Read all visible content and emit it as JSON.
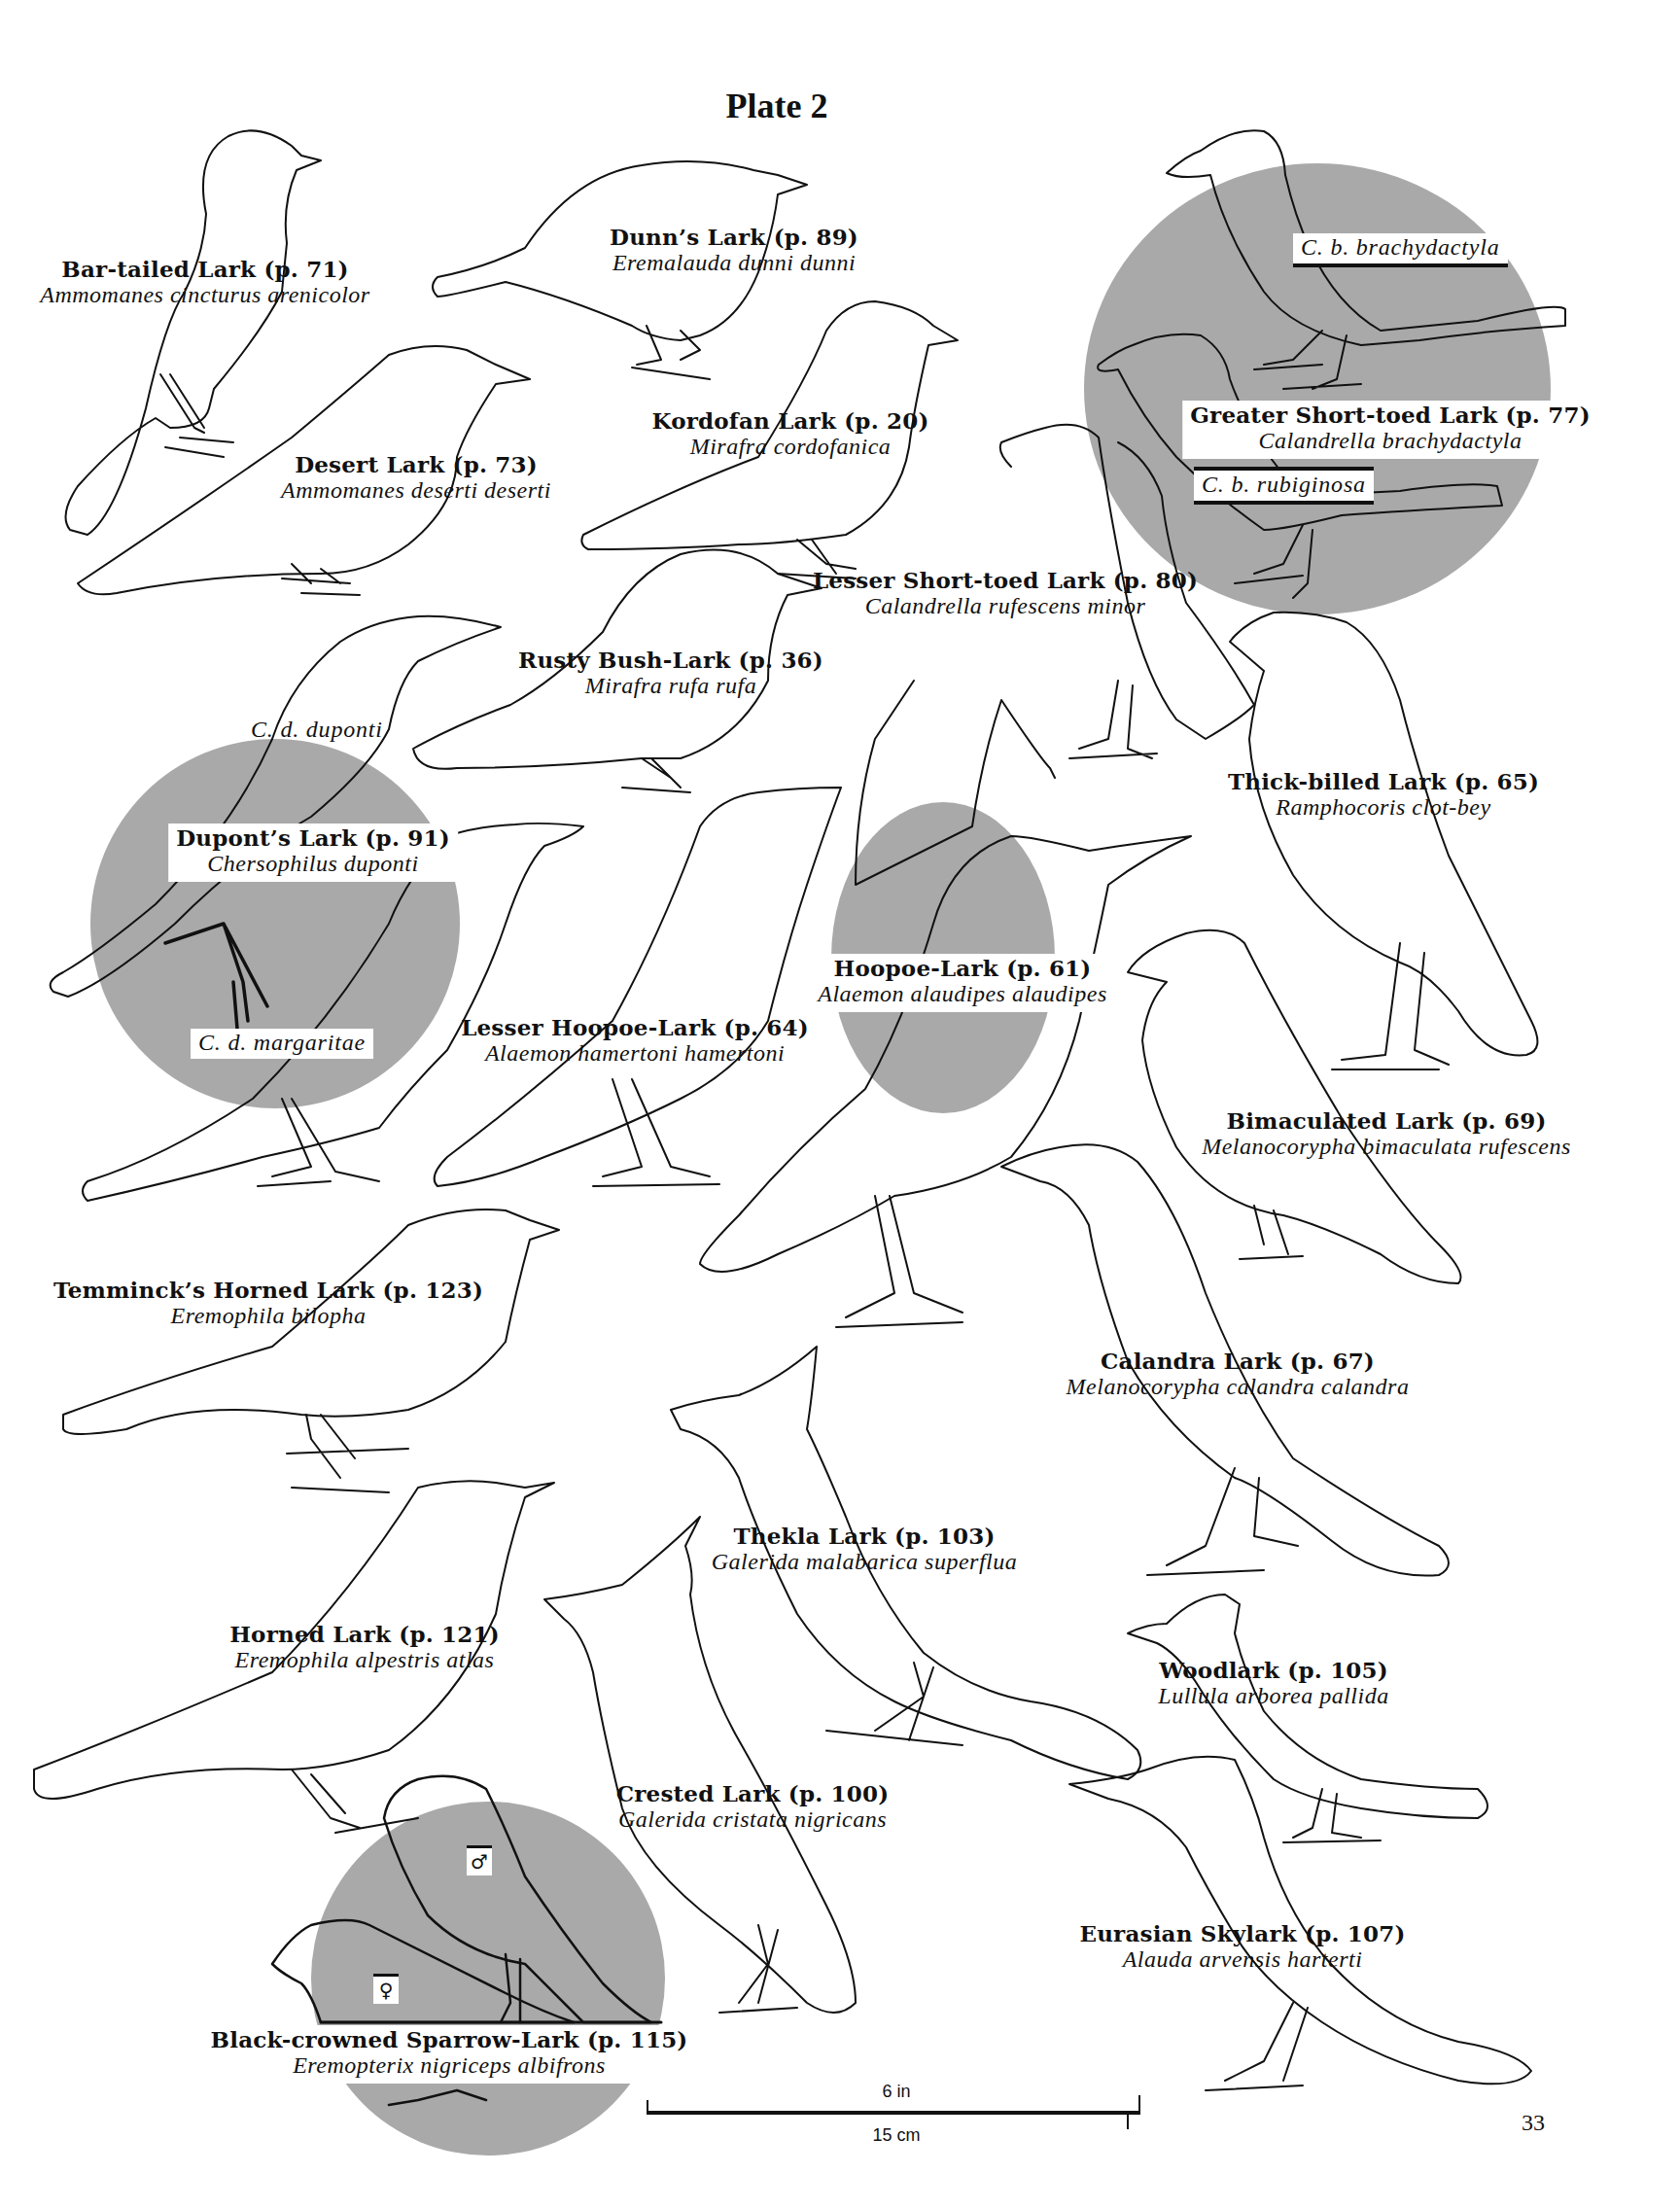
{
  "page": {
    "title": "Plate 2",
    "page_number": "33",
    "shading_color": "#a9a9a9",
    "line_color": "#111111"
  },
  "scale_bar": {
    "top_label": "6 in",
    "bottom_label": "15 cm"
  },
  "species": [
    {
      "common": "Bar-tailed Lark (p. 71)",
      "scientific": "Ammomanes cincturus arenicolor"
    },
    {
      "common": "Dunn’s Lark (p. 89)",
      "scientific": "Eremalauda dunni dunni"
    },
    {
      "common": "Greater Short-toed Lark (p. 77)",
      "scientific": "Calandrella brachydactyla"
    },
    {
      "common": "Desert Lark (p. 73)",
      "scientific": "Ammomanes deserti deserti"
    },
    {
      "common": "Kordofan Lark (p. 20)",
      "scientific": "Mirafra cordofanica"
    },
    {
      "common": "Lesser Short-toed Lark (p. 80)",
      "scientific": "Calandrella rufescens minor"
    },
    {
      "common": "Rusty Bush-Lark (p. 36)",
      "scientific": "Mirafra rufa rufa"
    },
    {
      "common": "Dupont’s Lark (p. 91)",
      "scientific": "Chersophilus duponti"
    },
    {
      "common": "Thick-billed Lark (p. 65)",
      "scientific": "Ramphocoris clot-bey"
    },
    {
      "common": "Hoopoe-Lark (p. 61)",
      "scientific": "Alaemon alaudipes alaudipes"
    },
    {
      "common": "Lesser Hoopoe-Lark (p. 64)",
      "scientific": "Alaemon hamertoni hamertoni"
    },
    {
      "common": "Bimaculated Lark (p. 69)",
      "scientific": "Melanocorypha bimaculata rufescens"
    },
    {
      "common": "Temminck’s Horned Lark (p. 123)",
      "scientific": "Eremophila bilopha"
    },
    {
      "common": "Calandra Lark (p. 67)",
      "scientific": "Melanocorypha calandra calandra"
    },
    {
      "common": "Thekla Lark (p. 103)",
      "scientific": "Galerida malabarica superflua"
    },
    {
      "common": "Horned Lark (p. 121)",
      "scientific": "Eremophila alpestris atlas"
    },
    {
      "common": "Woodlark (p. 105)",
      "scientific": "Lullula arborea pallida"
    },
    {
      "common": "Crested Lark (p. 100)",
      "scientific": "Galerida cristata nigricans"
    },
    {
      "common": "Eurasian Skylark (p. 107)",
      "scientific": "Alauda arvensis harterti"
    },
    {
      "common": "Black-crowned Sparrow-Lark (p. 115)",
      "scientific": "Eremopterix nigriceps albifrons"
    }
  ],
  "subspecies_labels": {
    "greater_short_toed_a": "C. b. brachydactyla",
    "greater_short_toed_b": "C. b. rubiginosa",
    "dupont_a": "C. d. duponti",
    "dupont_b": "C. d. margaritae"
  },
  "sex_symbols": {
    "male": "♂",
    "female": "♀"
  }
}
